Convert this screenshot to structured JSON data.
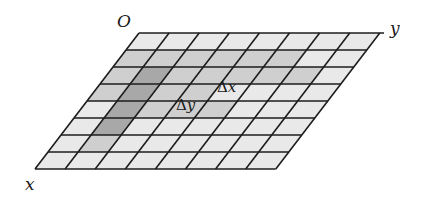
{
  "diagram": {
    "type": "oblique-grid",
    "labels": {
      "origin": "O",
      "x_axis": "x",
      "y_axis": "y",
      "delta_x": "Δx",
      "delta_y": "Δy"
    },
    "geometry": {
      "origin": [
        139,
        33
      ],
      "col_vector": [
        30.1,
        0
      ],
      "row_vector": [
        -13.0,
        17.0
      ],
      "cols": 8,
      "rows": 8,
      "y_axis_end": [
        384,
        33
      ]
    },
    "colors": {
      "line": "#1c1c1c",
      "light": "#e9e9e9",
      "mid": "#cfcfcf",
      "dark": "#a8a8a8"
    },
    "shading": [
      [
        "light",
        "light",
        "light",
        "light",
        "light",
        "light",
        "light",
        "light"
      ],
      [
        "mid",
        "mid",
        "mid",
        "mid",
        "mid",
        "mid",
        "light",
        "light"
      ],
      [
        "mid",
        "dark",
        "mid",
        "mid",
        "mid",
        "mid",
        "mid",
        "light"
      ],
      [
        "mid",
        "dark",
        "mid",
        "mid",
        "light",
        "light",
        "light",
        "light"
      ],
      [
        "light",
        "dark",
        "mid",
        "mid",
        "mid",
        "light",
        "light",
        "light"
      ],
      [
        "light",
        "dark",
        "light",
        "light",
        "light",
        "light",
        "light",
        "light"
      ],
      [
        "light",
        "mid",
        "light",
        "light",
        "light",
        "light",
        "light",
        "light"
      ],
      [
        "light",
        "light",
        "light",
        "light",
        "light",
        "light",
        "light",
        "light"
      ]
    ],
    "label_positions": {
      "origin": [
        117,
        13
      ],
      "x_axis": [
        25,
        176
      ],
      "y_axis": [
        390,
        20
      ],
      "delta_x": [
        217,
        80
      ],
      "delta_y": [
        176,
        98
      ]
    }
  }
}
